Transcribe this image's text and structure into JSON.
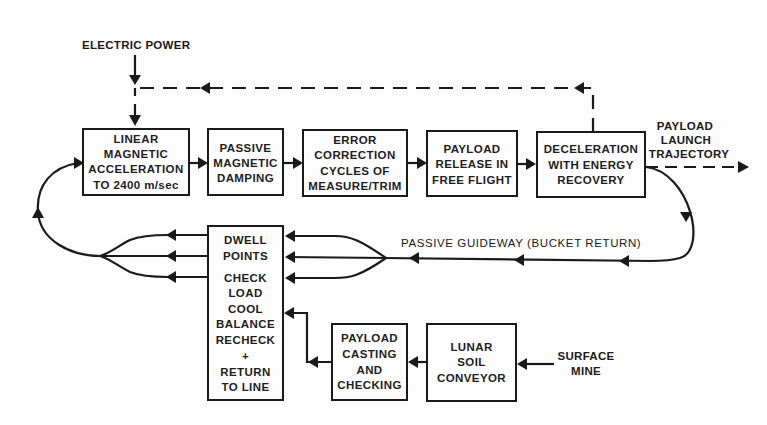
{
  "diagram": {
    "inputs": {
      "electric_power": "ELECTRIC POWER",
      "surface_mine": [
        "SURFACE",
        "MINE"
      ]
    },
    "boxes": {
      "linear_acceleration": [
        "LINEAR",
        "MAGNETIC",
        "ACCELERATION",
        "TO 2400 m/sec"
      ],
      "passive_damping": [
        "PASSIVE",
        "MAGNETIC",
        "DAMPING"
      ],
      "error_correction": [
        "ERROR",
        "CORRECTION",
        "CYCLES OF",
        "MEASURE/TRIM"
      ],
      "payload_release": [
        "PAYLOAD",
        "RELEASE IN",
        "FREE FLIGHT"
      ],
      "deceleration": [
        "DECELERATION",
        "WITH ENERGY",
        "RECOVERY"
      ],
      "dwell_points": [
        "DWELL",
        "POINTS",
        "CHECK",
        "LOAD",
        "COOL",
        "BALANCE",
        "RECHECK",
        "+",
        "RETURN",
        "TO LINE"
      ],
      "payload_casting": [
        "PAYLOAD",
        "CASTING",
        "AND",
        "CHECKING"
      ],
      "lunar_soil_conveyor": [
        "LUNAR",
        "SOIL",
        "CONVEYOR"
      ]
    },
    "outputs": {
      "payload_launch_trajectory": [
        "PAYLOAD",
        "LAUNCH",
        "TRAJECTORY"
      ]
    },
    "labels": {
      "passive_guideway": "PASSIVE GUIDEWAY (BUCKET RETURN)"
    },
    "colors": {
      "ink": "#1a1a1a",
      "background": "#fdfdfd"
    }
  }
}
